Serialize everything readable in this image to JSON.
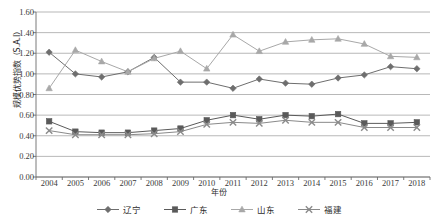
{
  "chart_data": {
    "type": "line",
    "title": "",
    "xlabel": "年份",
    "ylabel": "规模优势指数（S.A.I）",
    "categories": [
      "2004",
      "2005",
      "2006",
      "2007",
      "2008",
      "2009",
      "2010",
      "2011",
      "2012",
      "2013",
      "2014",
      "2015",
      "2016",
      "2017",
      "2018"
    ],
    "ylim": [
      0.0,
      1.6
    ],
    "yticks": [
      "0.00",
      "0.20",
      "0.40",
      "0.60",
      "0.80",
      "1.00",
      "1.20",
      "1.40",
      "1.60"
    ],
    "ytick_values": [
      0.0,
      0.2,
      0.4,
      0.6,
      0.8,
      1.0,
      1.2,
      1.4,
      1.6
    ],
    "grid": true,
    "legend_position": "bottom",
    "series": [
      {
        "name": "辽宁",
        "marker": "diamond",
        "color": "#6e6e6e",
        "values": [
          1.21,
          1.0,
          0.97,
          1.02,
          1.16,
          0.92,
          0.92,
          0.86,
          0.95,
          0.91,
          0.9,
          0.96,
          0.99,
          1.07,
          1.05
        ]
      },
      {
        "name": "广东",
        "marker": "square",
        "color": "#5a5a5a",
        "values": [
          0.54,
          0.44,
          0.43,
          0.43,
          0.45,
          0.47,
          0.55,
          0.6,
          0.56,
          0.6,
          0.59,
          0.61,
          0.52,
          0.52,
          0.53
        ]
      },
      {
        "name": "山东",
        "marker": "triangle",
        "color": "#a8a8a8",
        "values": [
          0.86,
          1.23,
          1.12,
          1.02,
          1.15,
          1.22,
          1.05,
          1.38,
          1.22,
          1.31,
          1.33,
          1.34,
          1.29,
          1.17,
          1.16
        ]
      },
      {
        "name": "福建",
        "marker": "cross",
        "color": "#8a8a8a",
        "values": [
          0.45,
          0.41,
          0.41,
          0.41,
          0.42,
          0.44,
          0.51,
          0.53,
          0.52,
          0.55,
          0.53,
          0.53,
          0.48,
          0.48,
          0.48
        ]
      }
    ]
  }
}
